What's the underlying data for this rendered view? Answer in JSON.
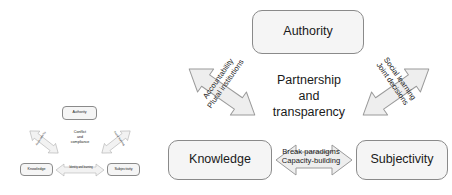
{
  "diagram": {
    "title": "",
    "colors": {
      "node_fill": "#f5f5f5",
      "node_stroke": "#8a8a8a",
      "arrow_fill": "#eeeeee",
      "arrow_stroke": "#9a9a9a",
      "text": "#1a1a1a",
      "background": "#ffffff"
    },
    "large": {
      "nodes": {
        "authority": "Authority",
        "knowledge": "Knowledge",
        "subjectivity": "Subjectivity"
      },
      "center_caption": "Partnership\nand\ntransparency",
      "arrows": [
        {
          "id": "knowledge-authority",
          "from": "Knowledge",
          "to": "Authority",
          "bidirectional": true,
          "label": "Accountability\nPlural institutions"
        },
        {
          "id": "authority-subjectivity",
          "from": "Authority",
          "to": "Subjectivity",
          "bidirectional": true,
          "label": "Social learning\nJoint decisions"
        },
        {
          "id": "knowledge-subjectivity",
          "from": "Knowledge",
          "to": "Subjectivity",
          "bidirectional": true,
          "label": "Break paradigms\nCapacity-building"
        }
      ]
    },
    "small": {
      "nodes": {
        "authority": "Authority",
        "knowledge": "Knowledge",
        "subjectivity": "Subjectivity"
      },
      "center_caption": "Conflict\nand\ncompliance",
      "arrows": [
        {
          "id": "sm-knowledge-authority",
          "from": "Knowledge",
          "to": "Authority",
          "bidirectional": true,
          "label": "Accountability"
        },
        {
          "id": "sm-authority-subjectivity",
          "from": "Authority",
          "to": "Subjectivity",
          "bidirectional": true,
          "label": "Social learning"
        },
        {
          "id": "sm-knowledge-subjectivity",
          "from": "Knowledge",
          "to": "Subjectivity",
          "bidirectional": true,
          "label": "Identity and learning"
        }
      ]
    }
  }
}
